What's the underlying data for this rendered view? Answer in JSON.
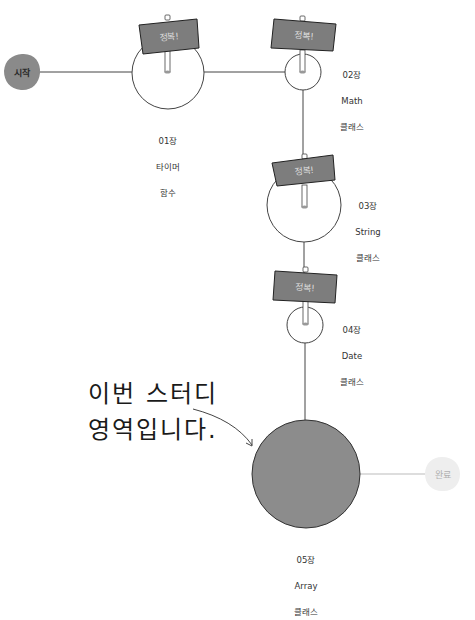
{
  "start": {
    "label": "시작",
    "fill": "#8a8a8a",
    "text_color": "#2a2a2a"
  },
  "end": {
    "label": "완료",
    "fill": "#eeeeee",
    "text_color": "#b0b0b0"
  },
  "sign_text": "정복!",
  "sign_color": "#7d7d7d",
  "chapters": [
    {
      "num": "01장",
      "title": "타이머",
      "sub": "함수",
      "status": "conquered"
    },
    {
      "num": "02장",
      "title": "Math",
      "sub": "클래스",
      "status": "conquered"
    },
    {
      "num": "03장",
      "title": "String",
      "sub": "클래스",
      "status": "conquered"
    },
    {
      "num": "04장",
      "title": "Date",
      "sub": "클래스",
      "status": "conquered"
    },
    {
      "num": "05장",
      "title": "Array",
      "sub": "클래스",
      "status": "current"
    }
  ],
  "current_fill": "#8c8c8c",
  "callout": {
    "line1": "이번 스터디",
    "line2": "영역입니다."
  }
}
